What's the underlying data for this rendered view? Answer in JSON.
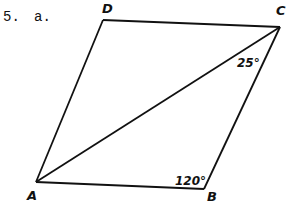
{
  "problem": {
    "number": "5.",
    "part": "a."
  },
  "figure": {
    "shape": "parallelogram",
    "vertices": [
      {
        "label": "A",
        "x": 36,
        "y": 182
      },
      {
        "label": "B",
        "x": 204,
        "y": 189
      },
      {
        "label": "C",
        "x": 280,
        "y": 27
      },
      {
        "label": "D",
        "x": 103,
        "y": 20
      }
    ],
    "diagonal": "AC",
    "angles": [
      {
        "vertex": "C",
        "between": "AC and BC",
        "label": "25°"
      },
      {
        "vertex": "B",
        "between": "AB and BC",
        "label": "120°"
      }
    ]
  },
  "labels": {
    "A": "A",
    "B": "B",
    "C": "C",
    "D": "D",
    "angle_c": "25°",
    "angle_b": "120°"
  }
}
